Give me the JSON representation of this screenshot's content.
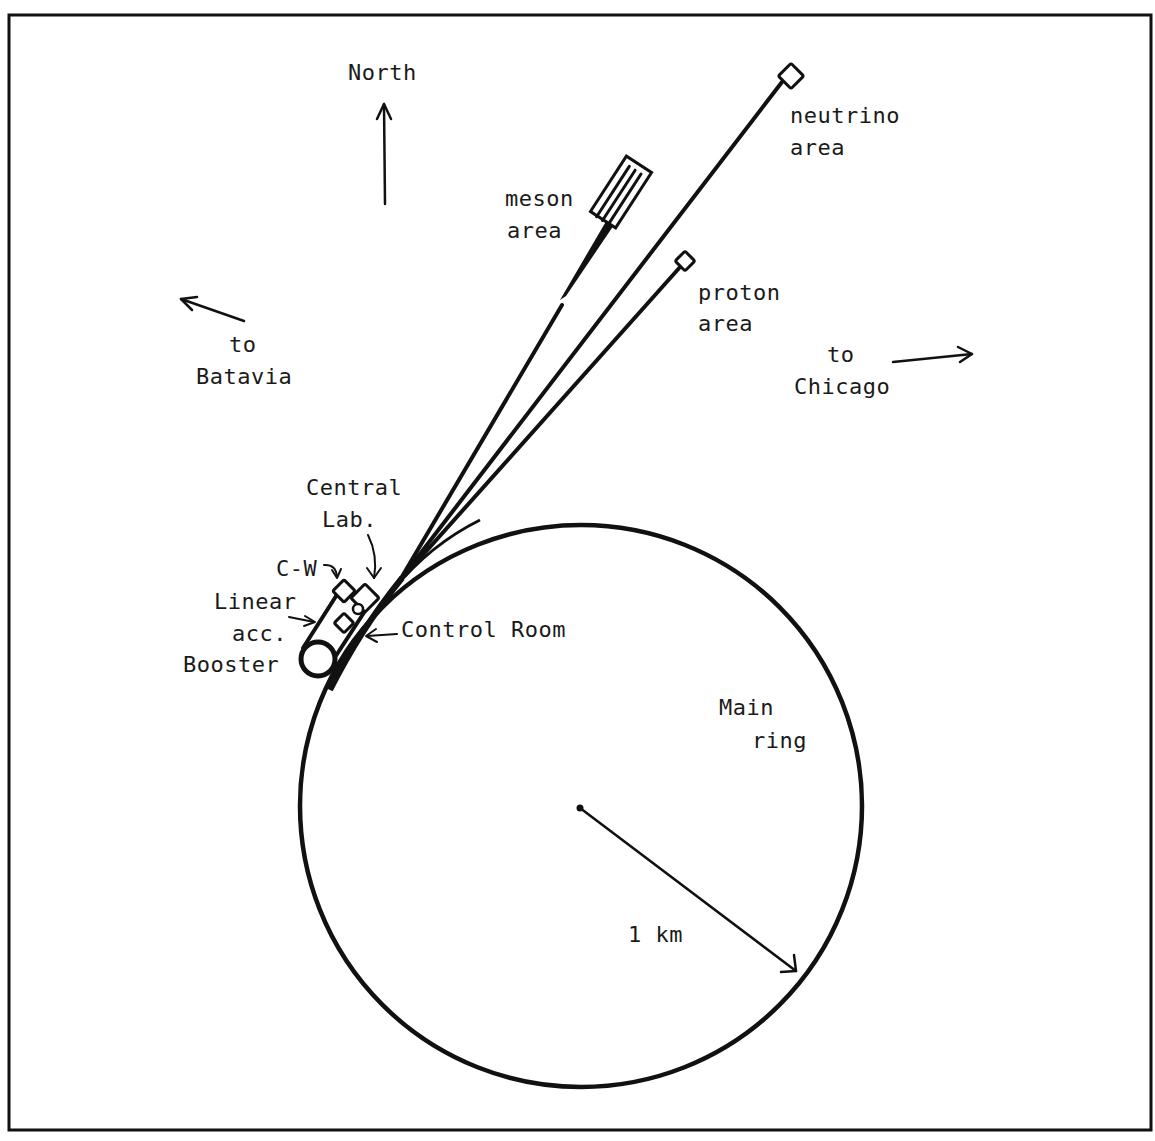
{
  "colors": {
    "ink": "#111111",
    "paper": "#ffffff"
  },
  "compass": {
    "north_label": "North",
    "icon": "arrow-up-icon"
  },
  "directions": {
    "batavia": {
      "line1": "to",
      "line2": "Batavia",
      "icon": "arrow-upleft-icon"
    },
    "chicago": {
      "line1": "to",
      "line2": "Chicago",
      "icon": "arrow-right-icon"
    }
  },
  "areas": {
    "meson": {
      "line1": "meson",
      "line2": "area"
    },
    "neutrino": {
      "line1": "neutrino",
      "line2": "area"
    },
    "proton": {
      "line1": "proton",
      "line2": "area"
    }
  },
  "facilities": {
    "central_lab": {
      "line1": "Central",
      "line2": "Lab."
    },
    "cw": {
      "label": "C-W"
    },
    "linear_acc": {
      "line1": "Linear",
      "line2": "acc."
    },
    "booster": {
      "label": "Booster"
    },
    "control_room": {
      "label": "Control Room"
    }
  },
  "main_ring": {
    "line1": "Main",
    "line2": "ring"
  },
  "scale": {
    "label": "1 km"
  }
}
